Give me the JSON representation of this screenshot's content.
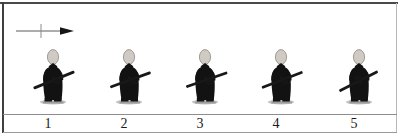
{
  "panel": {
    "title": "Walking sequence figure strip",
    "background_color": "#ffffff",
    "border_color": "#3f3f3f",
    "ground_line_color": "#8e8e8e"
  },
  "direction_indicator": {
    "name": "direction-arrow",
    "points": "right",
    "description": "horizontal line with a short vertical cross bar and a solid arrowhead pointing right",
    "line_color": "#5a5a5a",
    "arrowhead_color": "#151515"
  },
  "figure_style": {
    "robe_color": "#121212",
    "head_color": "#cfcbc4",
    "head_outline_color": "#8e8a83",
    "sword_color": "#181818",
    "sandal_color": "#9c9c9c",
    "shadow_color": "#c3c3c3"
  },
  "figures": [
    {
      "number": "1",
      "label": "1",
      "x": 20,
      "pose": "mid-stride, sword angled low across body",
      "sword_angle_deg": -22,
      "head_tilt": "upright"
    },
    {
      "number": "2",
      "label": "2",
      "x": 96,
      "pose": "forward step, sword angled low across body",
      "sword_angle_deg": -20,
      "head_tilt": "upright"
    },
    {
      "number": "3",
      "label": "3",
      "x": 172,
      "pose": "stride, sword angled low across body",
      "sword_angle_deg": -19,
      "head_tilt": "upright"
    },
    {
      "number": "4",
      "label": "4",
      "x": 248,
      "pose": "stride, sword angled low across body",
      "sword_angle_deg": -21,
      "head_tilt": "upright"
    },
    {
      "number": "5",
      "label": "5",
      "x": 324,
      "pose": "turning, sword swung further across body",
      "sword_angle_deg": -27,
      "head_tilt": "upright"
    }
  ],
  "number_labels": [
    "1",
    "2",
    "3",
    "4",
    "5"
  ]
}
